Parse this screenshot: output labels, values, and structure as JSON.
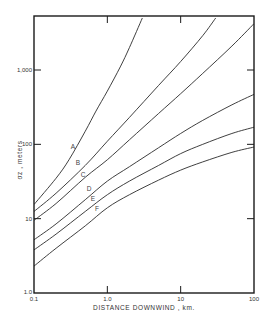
{
  "chart_data": {
    "type": "line",
    "title": "",
    "xlabel": "DISTANCE DOWNWIND , km.",
    "ylabel": "σz , meters",
    "xscale": "log",
    "yscale": "log",
    "xlim": [
      0.1,
      100
    ],
    "ylim": [
      1.0,
      5000
    ],
    "grid": false,
    "legend": "inline curve labels",
    "x_ticks": [
      {
        "value": 0.1,
        "label": "0.1"
      },
      {
        "value": 1.0,
        "label": "1.0"
      },
      {
        "value": 10,
        "label": "10"
      },
      {
        "value": 100,
        "label": "100"
      }
    ],
    "y_ticks": [
      {
        "value": 1.0,
        "label": "1.0"
      },
      {
        "value": 10,
        "label": "10"
      },
      {
        "value": 100,
        "label": "100"
      },
      {
        "value": 1000,
        "label": "1,000"
      }
    ],
    "series": [
      {
        "name": "A",
        "x": [
          0.1,
          0.2,
          0.3,
          0.5,
          0.7,
          1.0,
          1.5,
          2.0,
          3.0
        ],
        "y": [
          15.5,
          35,
          62,
          150,
          280,
          520,
          1100,
          2000,
          5000
        ]
      },
      {
        "name": "B",
        "x": [
          0.1,
          0.2,
          0.5,
          1.0,
          2.0,
          5.0,
          10,
          20,
          30
        ],
        "y": [
          12.5,
          22,
          52,
          110,
          230,
          620,
          1300,
          2900,
          5000
        ]
      },
      {
        "name": "C",
        "x": [
          0.1,
          0.2,
          0.5,
          1.0,
          2.0,
          5.0,
          10,
          20,
          50,
          100
        ],
        "y": [
          9.5,
          16,
          36,
          62,
          115,
          260,
          480,
          900,
          2100,
          4200
        ]
      },
      {
        "name": "D",
        "x": [
          0.1,
          0.2,
          0.5,
          1.0,
          2.0,
          5.0,
          10,
          20,
          50,
          100
        ],
        "y": [
          5.2,
          8.5,
          18,
          32,
          50,
          90,
          140,
          210,
          340,
          470
        ]
      },
      {
        "name": "E",
        "x": [
          0.1,
          0.2,
          0.5,
          1.0,
          2.0,
          5.0,
          10,
          20,
          50,
          100
        ],
        "y": [
          3.8,
          6.2,
          12.5,
          21,
          32,
          52,
          75,
          100,
          140,
          170
        ]
      },
      {
        "name": "F",
        "x": [
          0.1,
          0.2,
          0.5,
          1.0,
          2.0,
          5.0,
          10,
          20,
          50,
          100
        ],
        "y": [
          2.3,
          4.0,
          8.0,
          14,
          21,
          33,
          45,
          58,
          78,
          92
        ]
      }
    ],
    "curve_label_positions": [
      {
        "name": "A",
        "px": 73,
        "py": 149
      },
      {
        "name": "B",
        "px": 78,
        "py": 165
      },
      {
        "name": "C",
        "px": 83,
        "py": 177
      },
      {
        "name": "D",
        "px": 89,
        "py": 191
      },
      {
        "name": "E",
        "px": 93,
        "py": 201
      },
      {
        "name": "F",
        "px": 97,
        "py": 211
      }
    ]
  },
  "colors": {
    "axis": "#1a1a1a",
    "curve": "#2a2a2a",
    "background": "#ffffff"
  }
}
